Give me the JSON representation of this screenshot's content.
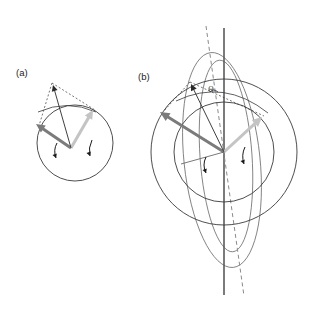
{
  "figure": {
    "width": 320,
    "height": 310,
    "background": "#ffffff",
    "panels": [
      {
        "id": "a",
        "label": "(a)",
        "label_pos": [
          16,
          76
        ],
        "center": [
          71,
          148
        ],
        "circles": [
          {
            "name": "body-circle",
            "cx": 75,
            "cy": 143,
            "r": 38,
            "color": "#3a3a3a",
            "width": 0.9
          }
        ],
        "vectors": [
          {
            "name": "angular-momentum-vector",
            "from": [
              71,
              148
            ],
            "to": [
              36,
              124
            ],
            "color": "#7b7b7b",
            "width": 3.0,
            "head": 5.2
          },
          {
            "name": "rotation-axis-vector",
            "from": [
              71,
              148
            ],
            "to": [
              93,
              110
            ],
            "color": "#c4c4c4",
            "width": 3.0,
            "head": 5.2
          },
          {
            "name": "precession-axis-vector",
            "from": [
              71,
              148
            ],
            "to": [
              53,
              85
            ],
            "color": "#2a2a2a",
            "width": 0.9,
            "head": 3.6
          }
        ],
        "dashed_lines": [
          {
            "name": "dashed-edge-left",
            "from": [
              52,
              83
            ],
            "to": [
              38,
              129
            ],
            "color": "#3a3a3a",
            "width": 0.7,
            "dash": "2,2"
          },
          {
            "name": "dashed-edge-right",
            "from": [
              52,
              83
            ],
            "to": [
              95,
              110
            ],
            "color": "#3a3a3a",
            "width": 0.7,
            "dash": "2,2"
          }
        ],
        "arcs": [
          {
            "name": "apex-arc",
            "d": "M 38 112 Q 67 99 96 112",
            "color": "#3a3a3a",
            "width": 0.8
          }
        ],
        "spin_arrows": [
          {
            "name": "spin-arrow-left",
            "d": "M 57 143 Q 53 150 56 158",
            "color": "#1a1a1a",
            "width": 1.0,
            "tip": [
              56,
              158
            ],
            "tip_angle": 70
          },
          {
            "name": "spin-arrow-right",
            "d": "M 92 140 Q 88 148 90 156",
            "color": "#1a1a1a",
            "width": 1.0,
            "tip": [
              90,
              156
            ],
            "tip_angle": 70
          }
        ]
      },
      {
        "id": "b",
        "label": "(b)",
        "label_pos": [
          138,
          80
        ],
        "center": [
          224,
          152
        ],
        "circles": [
          {
            "name": "outer-circle",
            "cx": 224,
            "cy": 152,
            "r": 73,
            "color": "#3a3a3a",
            "width": 0.9
          },
          {
            "name": "inner-circle",
            "cx": 224,
            "cy": 152,
            "r": 50,
            "color": "#3a3a3a",
            "width": 0.9
          }
        ],
        "ellipses": [
          {
            "name": "outer-orbit-ellipse",
            "cx": 222,
            "cy": 160,
            "rx": 38,
            "ry": 108,
            "rot": -6,
            "color": "#6a6a6a",
            "width": 0.8
          },
          {
            "name": "inner-orbit-ellipse",
            "cx": 226,
            "cy": 156,
            "rx": 26,
            "ry": 96,
            "rot": -4,
            "color": "#6a6a6a",
            "width": 0.8
          }
        ],
        "axes": [
          {
            "name": "vertical-axis",
            "from": [
              224,
              28
            ],
            "to": [
              224,
              295
            ],
            "color": "#5a5a5a",
            "width": 1.6,
            "dash": ""
          },
          {
            "name": "tilted-axis",
            "from": [
              206,
              26
            ],
            "to": [
              244,
              296
            ],
            "color": "#8a8a8a",
            "width": 1.0,
            "dash": "4,3"
          }
        ],
        "vectors": [
          {
            "name": "angular-momentum-vector",
            "from": [
              224,
              152
            ],
            "to": [
              160,
              112
            ],
            "color": "#7b7b7b",
            "width": 3.0,
            "head": 5.6
          },
          {
            "name": "rotation-axis-vector",
            "from": [
              224,
              152
            ],
            "to": [
              262,
              117
            ],
            "color": "#c4c4c4",
            "width": 3.0,
            "head": 5.6
          },
          {
            "name": "precession-axis-vector",
            "from": [
              224,
              152
            ],
            "to": [
              191,
              84
            ],
            "color": "#2a2a2a",
            "width": 0.9,
            "head": 3.8
          },
          {
            "name": "radius-marker",
            "from": [
              224,
              152
            ],
            "to": [
              181,
              164
            ],
            "color": "#6a6a6a",
            "width": 0.9,
            "head": 0
          }
        ],
        "dashed_lines": [
          {
            "name": "dashed-edge-left",
            "from": [
              190,
              82
            ],
            "to": [
              163,
              112
            ],
            "color": "#3a3a3a",
            "width": 0.7,
            "dash": "2,2"
          },
          {
            "name": "dashed-edge-right",
            "from": [
              190,
              82
            ],
            "to": [
              264,
              116
            ],
            "color": "#3a3a3a",
            "width": 0.7,
            "dash": "2,2"
          }
        ],
        "arcs": [
          {
            "name": "apex-arc",
            "d": "M 176 101 Q 224 78 268 113",
            "color": "#3a3a3a",
            "width": 0.8
          },
          {
            "name": "theta-arc",
            "d": "M 218 92 Q 213 88 210 92",
            "color": "#2b2b2b",
            "width": 0.8
          }
        ],
        "spin_arrows": [
          {
            "name": "spin-arrow-left",
            "d": "M 206 157 Q 202 165 206 173",
            "color": "#1a1a1a",
            "width": 1.0,
            "tip": [
              206,
              173
            ],
            "tip_angle": 70
          },
          {
            "name": "spin-arrow-right",
            "d": "M 245 147 Q 241 155 244 164",
            "color": "#1a1a1a",
            "width": 1.0,
            "tip": [
              244,
              164
            ],
            "tip_angle": 70
          }
        ],
        "annotations": [
          {
            "name": "theta-angle-label",
            "text": "Θ",
            "x": 211,
            "y": 92
          }
        ]
      }
    ]
  }
}
